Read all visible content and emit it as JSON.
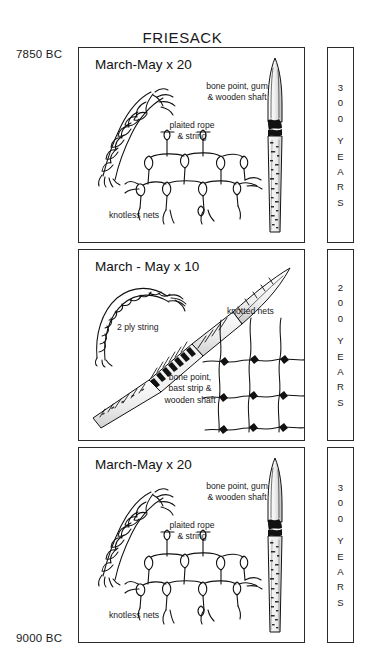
{
  "figure": {
    "title": "FRIESACK",
    "date_top": "7850 BC",
    "date_bottom": "9000 BC"
  },
  "panels": [
    {
      "id": "panel-1",
      "heading": "March-May x 20",
      "labels": {
        "rope": "plaited rope\n& string",
        "rope_line1": "plaited rope",
        "rope_line2": "& string",
        "net": "knotless nets",
        "point_line1": "bone point, gum",
        "point_line2": "& wooden shaft"
      },
      "duration": {
        "digits": [
          "3",
          "0",
          "0"
        ],
        "word": [
          "Y",
          "E",
          "A",
          "R",
          "S"
        ],
        "text": "300 YEARS"
      }
    },
    {
      "id": "panel-2",
      "heading": "March - May x 10",
      "labels": {
        "string": "2 ply string",
        "net": "knotted nets",
        "point_line1": "bone point,",
        "point_line2": "bast strip &",
        "point_line3": "wooden shaft"
      },
      "duration": {
        "digits": [
          "2",
          "0",
          "0"
        ],
        "word": [
          "Y",
          "E",
          "A",
          "R",
          "S"
        ],
        "text": "200 YEARS"
      }
    },
    {
      "id": "panel-3",
      "heading": "March-May x 20",
      "labels": {
        "rope_line1": "plaited rope",
        "rope_line2": "& string",
        "net": "knotless nets",
        "point_line1": "bone point, gum",
        "point_line2": "& wooden shaft"
      },
      "duration": {
        "digits": [
          "3",
          "0",
          "0"
        ],
        "word": [
          "Y",
          "E",
          "A",
          "R",
          "S"
        ],
        "text": "300 YEARS"
      }
    }
  ],
  "colors": {
    "ink": "#111111",
    "border": "#2b2b2b",
    "background": "#ffffff"
  }
}
